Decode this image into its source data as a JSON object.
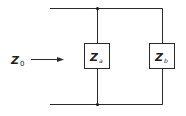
{
  "diagram": {
    "type": "circuit-parallel-impedance",
    "input": {
      "label_main": "Z",
      "label_sub": "0",
      "arrow": "right-arrow"
    },
    "components": [
      {
        "id": "za",
        "label_main": "Z",
        "label_sub": "a"
      },
      {
        "id": "zb",
        "label_main": "Z",
        "label_sub": "b"
      }
    ],
    "junctions": [
      "top-junction",
      "bottom-junction"
    ],
    "colors": {
      "line": "#2a2a2a",
      "background": "#ffffff"
    }
  }
}
